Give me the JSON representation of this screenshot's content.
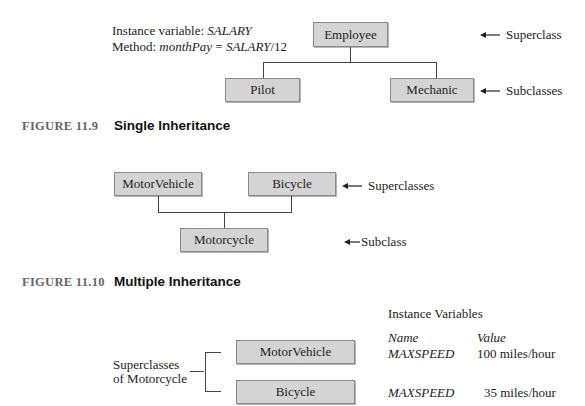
{
  "figure_11_9": {
    "annotation": {
      "line1_prefix": "Instance variable: ",
      "line1_var": "SALARY",
      "line2_prefix": "Method: ",
      "line2_method": "monthPay",
      "line2_eq": " = ",
      "line2_expr": "SALARY",
      "line2_suffix": "/12"
    },
    "superclass": "Employee",
    "subclasses": [
      "Pilot",
      "Mechanic"
    ],
    "label_superclass": "Superclass",
    "label_subclasses": "Subclasses",
    "caption_number": "FIGURE 11.9",
    "caption_title": "Single Inheritance"
  },
  "figure_11_10": {
    "superclasses": [
      "MotorVehicle",
      "Bicycle"
    ],
    "subclass": "Motorcycle",
    "label_superclasses": "Superclasses",
    "label_subclass": "Subclass",
    "caption_number": "FIGURE 11.10",
    "caption_title": "Multiple Inheritance"
  },
  "figure_11_11": {
    "bracket_label_line1": "Superclasses",
    "bracket_label_line2": "of Motorcycle",
    "classes": [
      "MotorVehicle",
      "Bicycle"
    ],
    "table_title": "Instance Variables",
    "col_name": "Name",
    "col_value": "Value",
    "rows": [
      {
        "name": "MAXSPEED",
        "value": "100 miles/hour"
      },
      {
        "name": "MAXSPEED",
        "value": "35 miles/hour"
      }
    ]
  },
  "colors": {
    "box_fill": "#d4d4d4",
    "box_border": "#8a8a8a",
    "caption_number": "#666666"
  }
}
